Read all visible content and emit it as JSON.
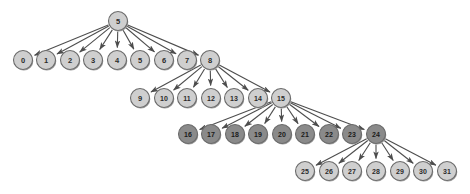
{
  "diagram": {
    "node_radius": 9.5,
    "colors": {
      "light_node_fill": "#cfcfcf",
      "dark_node_fill": "#8a8a8a",
      "node_stroke": "#6b6b6b",
      "node_shadow": "#9a9a9a",
      "edge_stroke": "#4d4d4d",
      "label_color": "#2b2b2b",
      "background": "#ffffff"
    },
    "nodes": [
      {
        "id": "5-root",
        "label": "5",
        "x": 118,
        "y": 21,
        "shade": "light"
      },
      {
        "id": "0",
        "label": "0",
        "x": 23,
        "y": 60,
        "shade": "light"
      },
      {
        "id": "1",
        "label": "1",
        "x": 46,
        "y": 60,
        "shade": "light"
      },
      {
        "id": "2",
        "label": "2",
        "x": 70,
        "y": 60,
        "shade": "light"
      },
      {
        "id": "3",
        "label": "3",
        "x": 93,
        "y": 60,
        "shade": "light"
      },
      {
        "id": "4",
        "label": "4",
        "x": 117,
        "y": 60,
        "shade": "light"
      },
      {
        "id": "5",
        "label": "5",
        "x": 140,
        "y": 60,
        "shade": "light"
      },
      {
        "id": "6",
        "label": "6",
        "x": 164,
        "y": 60,
        "shade": "light"
      },
      {
        "id": "7",
        "label": "7",
        "x": 187,
        "y": 60,
        "shade": "light"
      },
      {
        "id": "8",
        "label": "8",
        "x": 210,
        "y": 60,
        "shade": "light"
      },
      {
        "id": "9",
        "label": "9",
        "x": 140,
        "y": 98,
        "shade": "light"
      },
      {
        "id": "10",
        "label": "10",
        "x": 164,
        "y": 98,
        "shade": "light"
      },
      {
        "id": "11",
        "label": "11",
        "x": 187,
        "y": 98,
        "shade": "light"
      },
      {
        "id": "12",
        "label": "12",
        "x": 211,
        "y": 98,
        "shade": "light"
      },
      {
        "id": "13",
        "label": "13",
        "x": 234,
        "y": 98,
        "shade": "light"
      },
      {
        "id": "14",
        "label": "14",
        "x": 258,
        "y": 98,
        "shade": "light"
      },
      {
        "id": "15",
        "label": "15",
        "x": 281,
        "y": 98,
        "shade": "light"
      },
      {
        "id": "16",
        "label": "16",
        "x": 188,
        "y": 134,
        "shade": "dark"
      },
      {
        "id": "17",
        "label": "17",
        "x": 211,
        "y": 134,
        "shade": "dark"
      },
      {
        "id": "18",
        "label": "18",
        "x": 235,
        "y": 134,
        "shade": "dark"
      },
      {
        "id": "19",
        "label": "19",
        "x": 258,
        "y": 134,
        "shade": "dark"
      },
      {
        "id": "20",
        "label": "20",
        "x": 282,
        "y": 134,
        "shade": "dark"
      },
      {
        "id": "21",
        "label": "21",
        "x": 305,
        "y": 134,
        "shade": "dark"
      },
      {
        "id": "22",
        "label": "22",
        "x": 329,
        "y": 134,
        "shade": "dark"
      },
      {
        "id": "23",
        "label": "23",
        "x": 352,
        "y": 134,
        "shade": "dark"
      },
      {
        "id": "24",
        "label": "24",
        "x": 376,
        "y": 134,
        "shade": "dark"
      },
      {
        "id": "25",
        "label": "25",
        "x": 305,
        "y": 171,
        "shade": "light"
      },
      {
        "id": "26",
        "label": "26",
        "x": 329,
        "y": 171,
        "shade": "light"
      },
      {
        "id": "27",
        "label": "27",
        "x": 352,
        "y": 171,
        "shade": "light"
      },
      {
        "id": "28",
        "label": "28",
        "x": 376,
        "y": 171,
        "shade": "light"
      },
      {
        "id": "29",
        "label": "29",
        "x": 400,
        "y": 171,
        "shade": "light"
      },
      {
        "id": "30",
        "label": "30",
        "x": 423,
        "y": 171,
        "shade": "light"
      },
      {
        "id": "31",
        "label": "31",
        "x": 447,
        "y": 171,
        "shade": "light"
      }
    ],
    "edges": [
      {
        "from": "5-root",
        "to": "0"
      },
      {
        "from": "5-root",
        "to": "1"
      },
      {
        "from": "5-root",
        "to": "2"
      },
      {
        "from": "5-root",
        "to": "3"
      },
      {
        "from": "5-root",
        "to": "4"
      },
      {
        "from": "5-root",
        "to": "5"
      },
      {
        "from": "5-root",
        "to": "6"
      },
      {
        "from": "5-root",
        "to": "7"
      },
      {
        "from": "5-root",
        "to": "8"
      },
      {
        "from": "8",
        "to": "9"
      },
      {
        "from": "8",
        "to": "10"
      },
      {
        "from": "8",
        "to": "11"
      },
      {
        "from": "8",
        "to": "12"
      },
      {
        "from": "8",
        "to": "13"
      },
      {
        "from": "8",
        "to": "14"
      },
      {
        "from": "8",
        "to": "15"
      },
      {
        "from": "15",
        "to": "16"
      },
      {
        "from": "15",
        "to": "17"
      },
      {
        "from": "15",
        "to": "18"
      },
      {
        "from": "15",
        "to": "19"
      },
      {
        "from": "15",
        "to": "20"
      },
      {
        "from": "15",
        "to": "21"
      },
      {
        "from": "15",
        "to": "22"
      },
      {
        "from": "15",
        "to": "23"
      },
      {
        "from": "15",
        "to": "24"
      },
      {
        "from": "24",
        "to": "25"
      },
      {
        "from": "24",
        "to": "26"
      },
      {
        "from": "24",
        "to": "27"
      },
      {
        "from": "24",
        "to": "28"
      },
      {
        "from": "24",
        "to": "29"
      },
      {
        "from": "24",
        "to": "30"
      },
      {
        "from": "24",
        "to": "31"
      }
    ]
  }
}
